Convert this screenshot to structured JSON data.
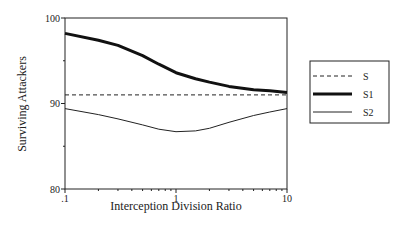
{
  "chart_data": {
    "type": "line",
    "title": "",
    "xlabel": "Interception Division Ratio",
    "ylabel": "Surviving Attackers",
    "x_scale": "log",
    "xlim": [
      0.1,
      10
    ],
    "ylim": [
      80,
      100
    ],
    "x_ticks": [
      ".1",
      "1",
      "10"
    ],
    "y_ticks": [
      "80",
      "90",
      "100"
    ],
    "grid": false,
    "legend_position": "right",
    "x": [
      0.1,
      0.2,
      0.3,
      0.5,
      0.7,
      1,
      1.5,
      2,
      3,
      5,
      7,
      10
    ],
    "series": [
      {
        "name": "S",
        "style": "dashed",
        "values": [
          91.0,
          91.0,
          91.0,
          91.0,
          91.0,
          91.0,
          91.0,
          91.0,
          91.0,
          91.0,
          91.0,
          91.0
        ]
      },
      {
        "name": "S1",
        "style": "thick",
        "values": [
          98.2,
          97.4,
          96.8,
          95.6,
          94.6,
          93.6,
          92.9,
          92.5,
          92.0,
          91.6,
          91.5,
          91.3
        ]
      },
      {
        "name": "S2",
        "style": "thin",
        "values": [
          89.4,
          88.7,
          88.2,
          87.5,
          87.0,
          86.7,
          86.8,
          87.1,
          87.8,
          88.6,
          89.0,
          89.4
        ]
      }
    ]
  },
  "legend": {
    "items": [
      {
        "label": "S"
      },
      {
        "label": "S1"
      },
      {
        "label": "S2"
      }
    ]
  }
}
